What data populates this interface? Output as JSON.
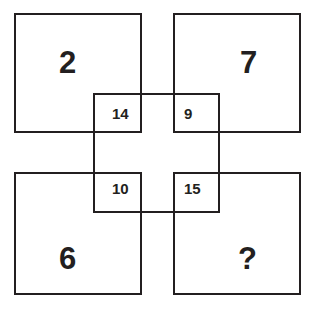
{
  "figure": {
    "type": "visual-reasoning-puzzle",
    "background_color": "#ffffff",
    "line_color": "#231f20"
  },
  "quadrants": {
    "top_left": {
      "value": "2"
    },
    "top_right": {
      "value": "7"
    },
    "bottom_left": {
      "value": "6"
    },
    "bottom_right": {
      "value": "?"
    }
  },
  "intersection_cells": {
    "top_left": {
      "value": "14"
    },
    "top_right": {
      "value": "9"
    },
    "bottom_left": {
      "value": "10"
    },
    "bottom_right": {
      "value": "15"
    }
  }
}
